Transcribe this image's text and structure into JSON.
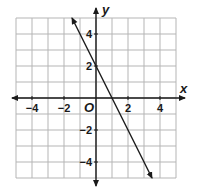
{
  "chart_data": {
    "type": "line",
    "title": "",
    "xlabel": "x",
    "ylabel": "y",
    "origin_label": "O",
    "xlim": [
      -5,
      5
    ],
    "ylim": [
      -5,
      5
    ],
    "grid": true,
    "x_ticks": [
      -4,
      -2,
      2,
      4
    ],
    "y_ticks": [
      4,
      2,
      -2,
      -4
    ],
    "x_tick_labels": [
      "−4",
      "−2",
      "2",
      "4"
    ],
    "y_tick_labels": [
      "4",
      "2",
      "−2",
      "−4"
    ],
    "series": [
      {
        "name": "y = -2x + 2",
        "equation": "y = -2x + 2",
        "slope": -2,
        "y_intercept": 2,
        "x_intercept": 1,
        "points": [
          [
            -1.5,
            5
          ],
          [
            0,
            2
          ],
          [
            1,
            0
          ],
          [
            3.5,
            -5
          ]
        ],
        "arrows": "both"
      }
    ]
  },
  "colors": {
    "grid": "#b5b5b5",
    "axis": "#1a1a1a",
    "line": "#1a1a1a",
    "background": "#ffffff"
  }
}
